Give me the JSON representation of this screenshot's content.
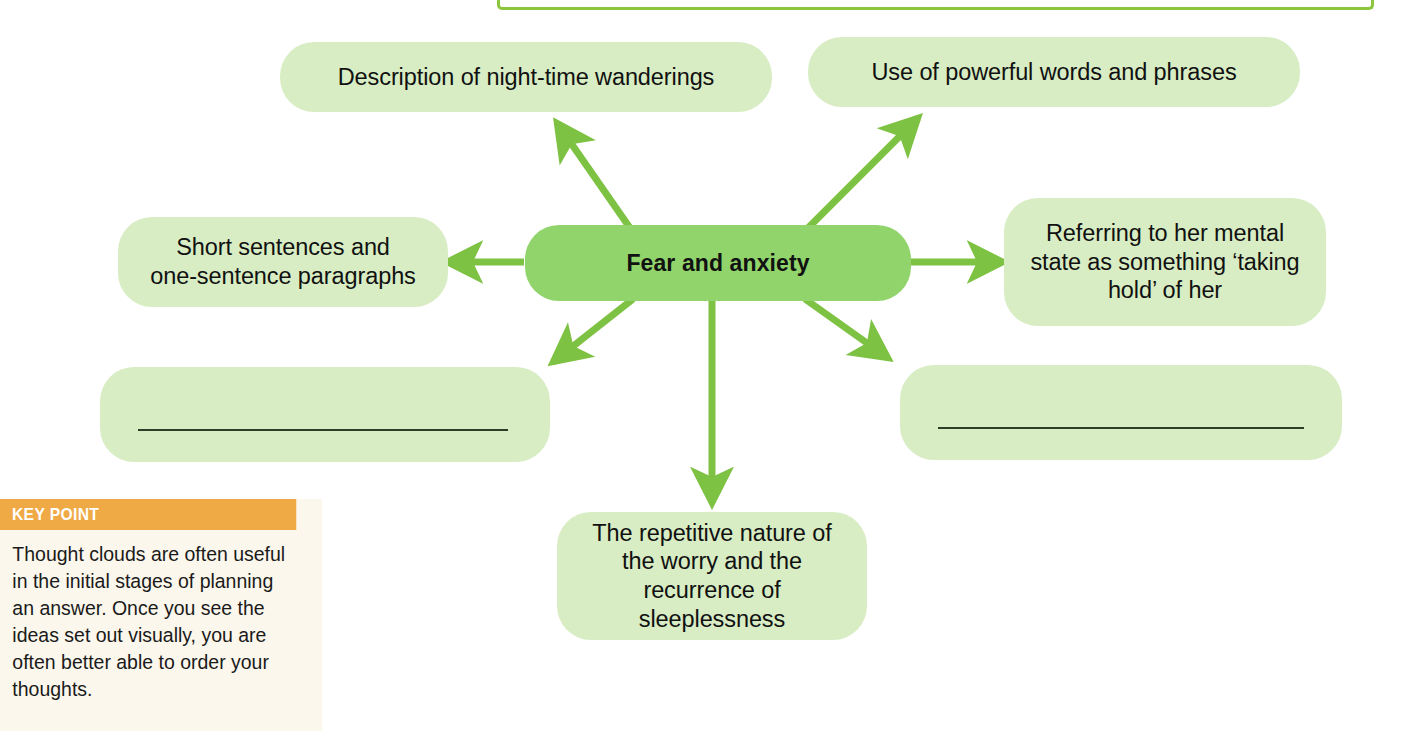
{
  "diagram": {
    "type": "mind-map",
    "center": {
      "label": "Fear and anxiety",
      "color": "#91d46c"
    },
    "branch_color": "#7dc242",
    "leaf_color": "#d8edc4",
    "branches": [
      {
        "id": "night-time-wanderings",
        "label": "Description of night-time wanderings",
        "position": "top-left"
      },
      {
        "id": "powerful-words",
        "label": "Use of powerful words and phrases",
        "position": "top-right"
      },
      {
        "id": "short-sentences",
        "label": "Short sentences and\none-sentence paragraphs",
        "position": "left"
      },
      {
        "id": "mental-state",
        "label": "Referring to her mental state as something ‘taking hold’ of her",
        "position": "right"
      },
      {
        "id": "blank-left",
        "label": "",
        "position": "bottom-left",
        "blank": true
      },
      {
        "id": "blank-right",
        "label": "",
        "position": "bottom-right",
        "blank": true
      },
      {
        "id": "repetitive-nature",
        "label": "The repetitive nature of the worry and the recurrence of sleeplessness",
        "position": "bottom"
      }
    ]
  },
  "key_point": {
    "header": "KEY POINT",
    "body": "Thought clouds are often useful in the initial stages of planning an answer. Once you see the ideas set out visually, you are often better able to order your thoughts.",
    "header_color": "#efa945",
    "body_color": "#fbf7ec"
  },
  "top_frame": {
    "border_color": "#8cc63f"
  }
}
